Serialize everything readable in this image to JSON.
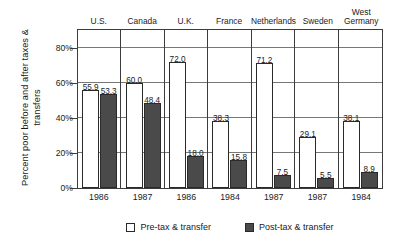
{
  "chart_data": {
    "type": "bar",
    "title": "",
    "xlabel": "",
    "ylabel": "Percent poor before and after taxes & transfers",
    "ylim": [
      0,
      90
    ],
    "grid": true,
    "legend_position": "bottom",
    "categories": [
      "U.S.",
      "Canada",
      "U.K.",
      "France",
      "Netherlands",
      "Sweden",
      "West Germany"
    ],
    "years": [
      "1986",
      "1987",
      "1986",
      "1984",
      "1987",
      "1987",
      "1984"
    ],
    "yticks": [
      "0%",
      "20%",
      "40%",
      "60%",
      "80%"
    ],
    "ytick_values": [
      0,
      20,
      40,
      60,
      80
    ],
    "series": [
      {
        "name": "Pre-tax & transfer",
        "color": "#ffffff",
        "values": [
          55.9,
          60.0,
          72.0,
          38.3,
          71.2,
          29.1,
          38.1
        ],
        "labels": [
          "55.9",
          "60.0",
          "72.0",
          "38.3",
          "71.2",
          "29.1",
          "38.1"
        ]
      },
      {
        "name": "Post-tax & transfer",
        "color": "#4a4a4a",
        "values": [
          53.3,
          48.4,
          18.0,
          15.8,
          7.5,
          5.5,
          8.9
        ],
        "labels": [
          "53.3",
          "48.4",
          "18.0",
          "15.8",
          "7.5",
          "5.5",
          "8.9"
        ]
      }
    ]
  },
  "legend": {
    "items": [
      {
        "label": "Pre-tax & transfer",
        "swatch": "pre"
      },
      {
        "label": "Post-tax & transfer",
        "swatch": "post"
      }
    ]
  },
  "colors": {
    "pre_tax_fill": "#ffffff",
    "post_tax_fill": "#4a4a4a",
    "axis": "#3c3c3c",
    "gridline": "#777777",
    "text": "#1a1a1a",
    "background": "#ffffff"
  }
}
